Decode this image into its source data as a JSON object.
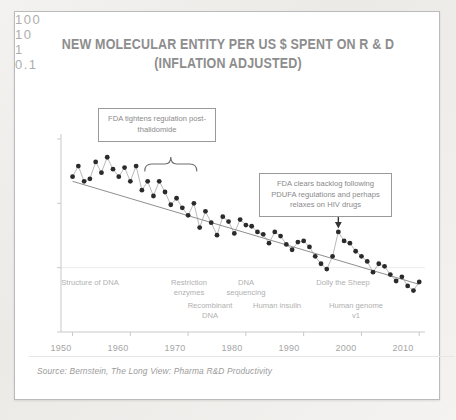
{
  "card": {
    "title_line1": "NEW MOLECULAR ENTITY PER US $ SPENT ON R & D",
    "title_line2": "(INFLATION ADJUSTED)",
    "source": "Source: Bernstein, The Long View: Pharma R&D Productivity"
  },
  "annotations": {
    "left_box": "FDA tightens regulation post-thalidomide",
    "right_box": "FDA clears backlog following PDUFA regulations and perhaps relaxes on HIV drugs"
  },
  "inline_labels": [
    {
      "text": "Structure of DNA",
      "x": 52,
      "y": 270,
      "w": 62
    },
    {
      "text": "Restriction enzymes",
      "x": 160,
      "y": 270,
      "w": 52
    },
    {
      "text": "DNA sequencing",
      "x": 218,
      "y": 270,
      "w": 48
    },
    {
      "text": "Recombinant DNA",
      "x": 180,
      "y": 294,
      "w": 56
    },
    {
      "text": "Human insulin",
      "x": 252,
      "y": 294,
      "w": 46
    },
    {
      "text": "Dolly the Sheep",
      "x": 318,
      "y": 270,
      "w": 50
    },
    {
      "text": "Human genome v1",
      "x": 328,
      "y": 294,
      "w": 56
    }
  ],
  "chart_data": {
    "type": "scatter",
    "title": "NEW MOLECULAR ENTITY PER US $ SPENT ON R & D (INFLATION ADJUSTED)",
    "xlabel": "",
    "ylabel": "",
    "xlim": [
      1948,
      2011
    ],
    "ylim": [
      0.1,
      100
    ],
    "yscale": "log",
    "grid": false,
    "legend": null,
    "xticks": [
      1950,
      1960,
      1970,
      1980,
      1990,
      2000,
      2010
    ],
    "yticks": [
      0.1,
      1,
      10,
      100
    ],
    "ytick_labels": [
      "0.1",
      "1",
      "10",
      "100"
    ],
    "series": [
      {
        "name": "NMEs per US $ spent on R&D",
        "x": [
          1950,
          1951,
          1952,
          1953,
          1954,
          1955,
          1956,
          1957,
          1958,
          1959,
          1960,
          1961,
          1962,
          1963,
          1964,
          1965,
          1966,
          1967,
          1968,
          1969,
          1970,
          1971,
          1972,
          1973,
          1974,
          1975,
          1976,
          1977,
          1978,
          1979,
          1980,
          1981,
          1982,
          1983,
          1984,
          1985,
          1986,
          1987,
          1988,
          1989,
          1990,
          1991,
          1992,
          1993,
          1994,
          1995,
          1996,
          1997,
          1998,
          1999,
          2000,
          2001,
          2002,
          2003,
          2004,
          2005,
          2006,
          2007,
          2008,
          2009,
          2010
        ],
        "y": [
          26,
          38,
          22,
          24,
          44,
          30,
          52,
          34,
          26,
          36,
          22,
          38,
          16,
          22,
          13,
          22,
          15,
          9.5,
          12,
          8.5,
          6.5,
          10,
          4.2,
          7.5,
          5.0,
          3.2,
          6.2,
          5.2,
          3.4,
          5.6,
          4.6,
          4.4,
          3.6,
          3.3,
          2.4,
          3.6,
          3.1,
          2.3,
          1.9,
          2.5,
          2.6,
          2.1,
          1.5,
          1.15,
          0.95,
          1.5,
          3.6,
          2.6,
          2.4,
          1.8,
          1.5,
          1.25,
          0.85,
          1.15,
          1.05,
          0.78,
          0.62,
          0.72,
          0.52,
          0.44,
          0.6
        ]
      },
      {
        "name": "trend",
        "type": "line",
        "x": [
          1950,
          2010
        ],
        "y": [
          22,
          0.55
        ]
      }
    ]
  },
  "icons": {
    "down_arrow": "down-arrow-icon",
    "brace": "curly-brace-icon"
  },
  "colors": {
    "point": "#2b2b2b",
    "connector": "#9b9b9b",
    "trend": "#8f8f8f",
    "axis": "#c9c9c9",
    "text": "#a6a6a6",
    "title": "#8d8d8d",
    "card_bg": "#ffffff",
    "page_bg": "#efeeec"
  }
}
